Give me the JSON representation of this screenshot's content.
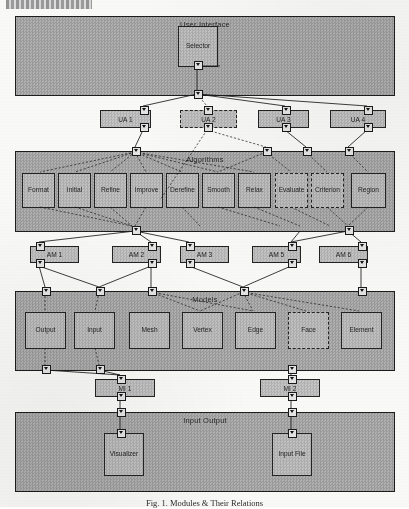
{
  "page": {
    "header_fragment": "",
    "caption": "Fig. 1. Modules & Their Relations"
  },
  "bands": [
    {
      "id": "user-interface",
      "title": "User Interface",
      "x": 15,
      "y": 16,
      "w": 378,
      "h": 78,
      "boxes": [
        {
          "label": "Selector",
          "x": 178,
          "y": 26,
          "w": 38,
          "h": 39,
          "dashed": false
        }
      ]
    },
    {
      "id": "algorithms",
      "title": "Algorithms",
      "x": 15,
      "y": 151,
      "w": 378,
      "h": 79,
      "boxes": [
        {
          "label": "Format",
          "x": 22,
          "y": 173,
          "w": 31,
          "h": 33,
          "dashed": false
        },
        {
          "label": "Initial",
          "x": 58,
          "y": 173,
          "w": 31,
          "h": 33,
          "dashed": false
        },
        {
          "label": "Refine",
          "x": 94,
          "y": 173,
          "w": 31,
          "h": 33,
          "dashed": false
        },
        {
          "label": "Improve",
          "x": 130,
          "y": 173,
          "w": 31,
          "h": 33,
          "dashed": false
        },
        {
          "label": "Derefine",
          "x": 166,
          "y": 173,
          "w": 31,
          "h": 33,
          "dashed": false
        },
        {
          "label": "Smooth",
          "x": 202,
          "y": 173,
          "w": 31,
          "h": 33,
          "dashed": false
        },
        {
          "label": "Relax",
          "x": 238,
          "y": 173,
          "w": 31,
          "h": 33,
          "dashed": false
        },
        {
          "label": "Evaluate",
          "x": 275,
          "y": 173,
          "w": 31,
          "h": 33,
          "dashed": true
        },
        {
          "label": "Criterion",
          "x": 311,
          "y": 173,
          "w": 31,
          "h": 33,
          "dashed": true
        },
        {
          "label": "Region",
          "x": 351,
          "y": 173,
          "w": 33,
          "h": 33,
          "dashed": false
        }
      ]
    },
    {
      "id": "models",
      "title": "Models",
      "x": 15,
      "y": 291,
      "w": 378,
      "h": 78,
      "boxes": [
        {
          "label": "Output",
          "x": 25,
          "y": 312,
          "w": 39,
          "h": 35,
          "dashed": false
        },
        {
          "label": "Input",
          "x": 74,
          "y": 312,
          "w": 39,
          "h": 35,
          "dashed": false
        },
        {
          "label": "Mesh",
          "x": 129,
          "y": 312,
          "w": 39,
          "h": 35,
          "dashed": false
        },
        {
          "label": "Vertex",
          "x": 182,
          "y": 312,
          "w": 39,
          "h": 35,
          "dashed": false
        },
        {
          "label": "Edge",
          "x": 235,
          "y": 312,
          "w": 39,
          "h": 35,
          "dashed": false
        },
        {
          "label": "Face",
          "x": 288,
          "y": 312,
          "w": 39,
          "h": 35,
          "dashed": true
        },
        {
          "label": "Element",
          "x": 341,
          "y": 312,
          "w": 39,
          "h": 35,
          "dashed": false
        }
      ]
    },
    {
      "id": "input-output",
      "title": "Input Output",
      "x": 15,
      "y": 412,
      "w": 378,
      "h": 78,
      "boxes": [
        {
          "label": "Visualizer",
          "x": 104,
          "y": 433,
          "w": 38,
          "h": 41,
          "dashed": false
        },
        {
          "label": "Input File",
          "x": 272,
          "y": 433,
          "w": 38,
          "h": 41,
          "dashed": false
        }
      ]
    }
  ],
  "interfaces": {
    "ua_row": [
      {
        "label": "UA 1",
        "x": 100,
        "y": 110,
        "w": 49,
        "h": 16,
        "dashed": false
      },
      {
        "label": "UA 2",
        "x": 180,
        "y": 110,
        "w": 55,
        "h": 16,
        "dashed": true
      },
      {
        "label": "UA 3",
        "x": 258,
        "y": 110,
        "w": 49,
        "h": 16,
        "dashed": false
      },
      {
        "label": "UA 4",
        "x": 330,
        "y": 110,
        "w": 54,
        "h": 16,
        "dashed": false
      }
    ],
    "am_row": [
      {
        "label": "AM 1",
        "x": 30,
        "y": 246,
        "w": 47,
        "h": 15,
        "dashed": false
      },
      {
        "label": "AM 2",
        "x": 112,
        "y": 246,
        "w": 47,
        "h": 15,
        "dashed": false
      },
      {
        "label": "AM 3",
        "x": 180,
        "y": 246,
        "w": 47,
        "h": 15,
        "dashed": false
      },
      {
        "label": "AM 5",
        "x": 252,
        "y": 246,
        "w": 47,
        "h": 15,
        "dashed": false
      },
      {
        "label": "AM 6",
        "x": 319,
        "y": 246,
        "w": 47,
        "h": 15,
        "dashed": false
      }
    ],
    "mi_row": [
      {
        "label": "MI 1",
        "x": 95,
        "y": 379,
        "w": 58,
        "h": 16,
        "dashed": false
      },
      {
        "label": "MI 2",
        "x": 260,
        "y": 379,
        "w": 58,
        "h": 16,
        "dashed": false
      }
    ]
  },
  "ports": [
    {
      "name": "selector-out",
      "x": 194,
      "y": 61
    },
    {
      "name": "ui-band-out",
      "x": 194,
      "y": 90
    },
    {
      "name": "ua1-in",
      "x": 140,
      "y": 106
    },
    {
      "name": "ua1-out",
      "x": 140,
      "y": 123
    },
    {
      "name": "ua2-in",
      "x": 204,
      "y": 106
    },
    {
      "name": "ua2-out",
      "x": 204,
      "y": 123
    },
    {
      "name": "ua3-in",
      "x": 282,
      "y": 106
    },
    {
      "name": "ua3-out",
      "x": 282,
      "y": 123
    },
    {
      "name": "ua4-in",
      "x": 364,
      "y": 106
    },
    {
      "name": "ua4-out",
      "x": 364,
      "y": 123
    },
    {
      "name": "alg-band-in-a",
      "x": 132,
      "y": 147
    },
    {
      "name": "alg-band-in-b",
      "x": 263,
      "y": 147
    },
    {
      "name": "alg-band-in-c",
      "x": 303,
      "y": 147
    },
    {
      "name": "alg-band-in-d",
      "x": 345,
      "y": 147
    },
    {
      "name": "alg-band-out",
      "x": 132,
      "y": 226
    },
    {
      "name": "alg-band-out2",
      "x": 345,
      "y": 226
    },
    {
      "name": "am1-in",
      "x": 36,
      "y": 242
    },
    {
      "name": "am1-out",
      "x": 36,
      "y": 259
    },
    {
      "name": "am2-in",
      "x": 148,
      "y": 242
    },
    {
      "name": "am2-out",
      "x": 148,
      "y": 259
    },
    {
      "name": "am3-in",
      "x": 186,
      "y": 242
    },
    {
      "name": "am3-out",
      "x": 186,
      "y": 259
    },
    {
      "name": "am5-in",
      "x": 288,
      "y": 242
    },
    {
      "name": "am5-out",
      "x": 288,
      "y": 259
    },
    {
      "name": "am6-in",
      "x": 358,
      "y": 242
    },
    {
      "name": "am6-out",
      "x": 358,
      "y": 259
    },
    {
      "name": "mod-band-in-a",
      "x": 42,
      "y": 287
    },
    {
      "name": "mod-band-in-b",
      "x": 96,
      "y": 287
    },
    {
      "name": "mod-band-in-c",
      "x": 148,
      "y": 287
    },
    {
      "name": "mod-band-in-d",
      "x": 240,
      "y": 287
    },
    {
      "name": "mod-band-in-e",
      "x": 358,
      "y": 287
    },
    {
      "name": "mod-out-a",
      "x": 42,
      "y": 365
    },
    {
      "name": "mod-out-b",
      "x": 96,
      "y": 365
    },
    {
      "name": "mod-out-c",
      "x": 288,
      "y": 365
    },
    {
      "name": "mi1-in",
      "x": 117,
      "y": 375
    },
    {
      "name": "mi1-out",
      "x": 117,
      "y": 392
    },
    {
      "name": "mi2-in",
      "x": 288,
      "y": 375
    },
    {
      "name": "mi2-out",
      "x": 288,
      "y": 392
    },
    {
      "name": "io-band-in-a",
      "x": 117,
      "y": 408
    },
    {
      "name": "io-band-in-b",
      "x": 288,
      "y": 408
    },
    {
      "name": "visualizer-in",
      "x": 117,
      "y": 429
    },
    {
      "name": "inputfile-in",
      "x": 288,
      "y": 429
    }
  ],
  "colors": {
    "band_fill": "#a8a8a8",
    "box_fill": "#b9b9b9",
    "bar_fill": "#bdbdbd",
    "stroke": "#1d1d1d",
    "page": "#fdfdfc"
  }
}
